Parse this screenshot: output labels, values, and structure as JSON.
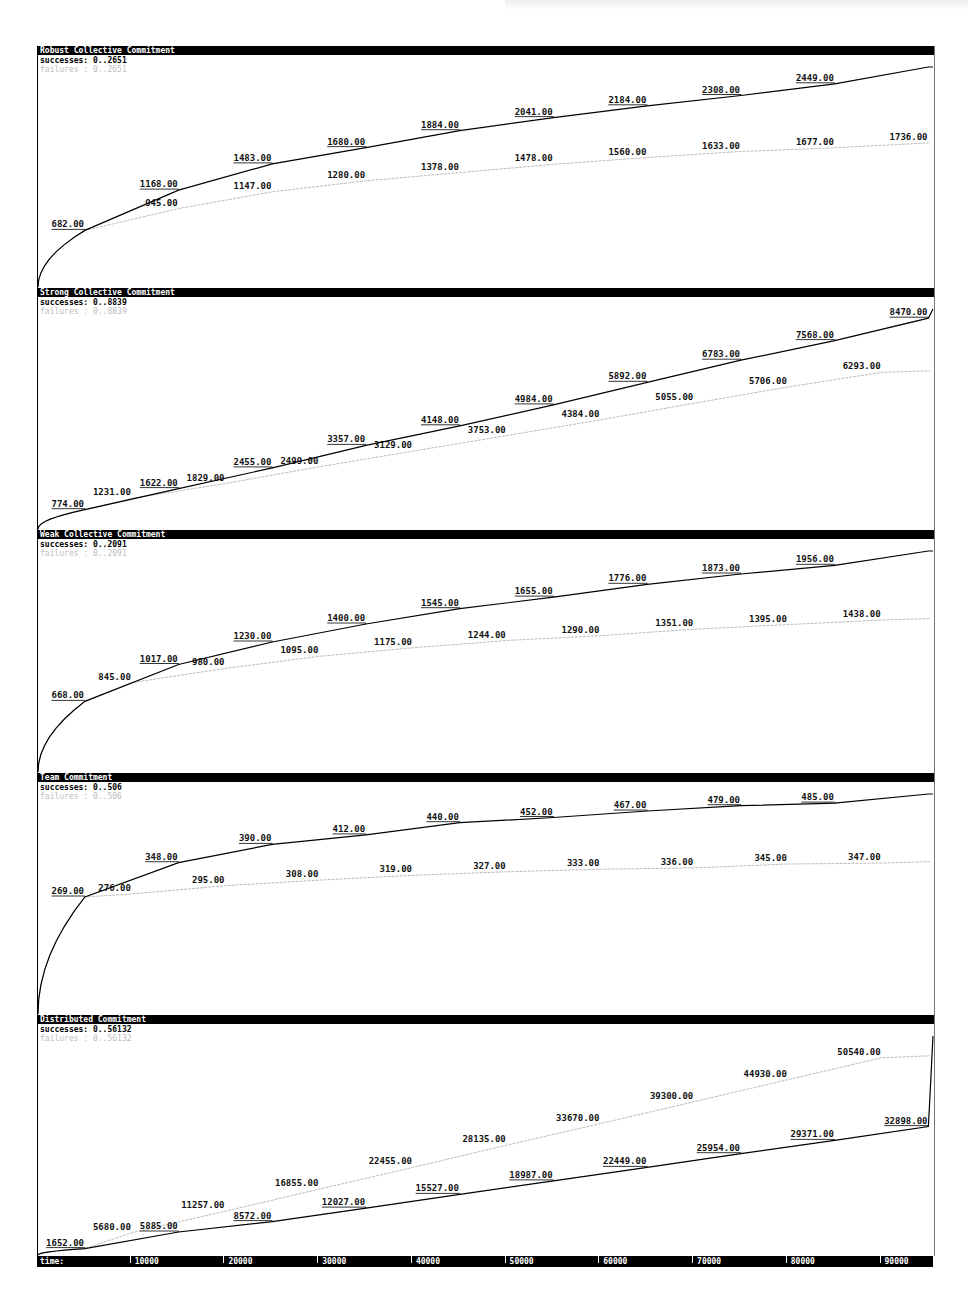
{
  "page": {
    "time_axis_label": "time:"
  },
  "chart_data": [
    {
      "type": "line",
      "title": "Robust Collective Commitment",
      "success_range": "successes: 0..2651",
      "failure_range": "failures : 0..2651",
      "ylim": [
        0,
        2651
      ],
      "x_ticks": [
        10000,
        20000,
        30000,
        40000,
        50000,
        60000,
        70000,
        80000,
        90000
      ],
      "series": [
        {
          "name": "successes",
          "color": "#000000",
          "x": [
            5000,
            15000,
            25000,
            35000,
            45000,
            55000,
            65000,
            75000,
            85000,
            95000
          ],
          "values": [
            682,
            1168,
            1483,
            1680,
            1884,
            2041,
            2184,
            2308,
            2449,
            2651
          ],
          "labels": [
            "682.00",
            "1168.00",
            "1483.00",
            "1680.00",
            "1884.00",
            "2041.00",
            "2184.00",
            "2308.00",
            "2449.00",
            ""
          ]
        },
        {
          "name": "failures",
          "color": "#bdbdbd",
          "x": [
            5000,
            15000,
            25000,
            35000,
            45000,
            55000,
            65000,
            75000,
            85000,
            95000
          ],
          "values": [
            682,
            945,
            1147,
            1280,
            1378,
            1478,
            1560,
            1633,
            1677,
            1736
          ],
          "labels": [
            "",
            "945.00",
            "1147.00",
            "1280.00",
            "1378.00",
            "1478.00",
            "1560.00",
            "1633.00",
            "1677.00",
            "1736.00"
          ]
        }
      ]
    },
    {
      "type": "line",
      "title": "Strong Collective Commitment",
      "success_range": "successes: 0..8839",
      "failure_range": "failures : 0..8839",
      "ylim": [
        0,
        8839
      ],
      "series": [
        {
          "name": "successes",
          "color": "#000000",
          "x": [
            5000,
            15000,
            25000,
            35000,
            45000,
            55000,
            65000,
            75000,
            85000,
            95000
          ],
          "values": [
            774,
            1622,
            2455,
            3357,
            4148,
            4984,
            5892,
            6783,
            7568,
            8470
          ],
          "labels": [
            "774.00",
            "1622.00",
            "2455.00",
            "3357.00",
            "4148.00",
            "4984.00",
            "5892.00",
            "6783.00",
            "7568.00",
            "8470.00"
          ]
        },
        {
          "name": "failures",
          "color": "#bdbdbd",
          "x": [
            5000,
            10000,
            20000,
            30000,
            40000,
            50000,
            60000,
            70000,
            80000,
            90000
          ],
          "values": [
            774,
            1231,
            1829,
            2499,
            3129,
            3753,
            4384,
            5055,
            5706,
            6293
          ],
          "labels": [
            "",
            "1231.00",
            "1829.00",
            "2499.00",
            "3129.00",
            "3753.00",
            "4384.00",
            "5055.00",
            "5706.00",
            "6293.00"
          ]
        }
      ]
    },
    {
      "type": "line",
      "title": "Weak Collective Commitment",
      "success_range": "successes: 0..2091",
      "failure_range": "failures : 0..2091",
      "ylim": [
        0,
        2091
      ],
      "series": [
        {
          "name": "successes",
          "color": "#000000",
          "x": [
            5000,
            15000,
            25000,
            35000,
            45000,
            55000,
            65000,
            75000,
            85000,
            95000
          ],
          "values": [
            668,
            1017,
            1230,
            1400,
            1545,
            1655,
            1776,
            1873,
            1956,
            2091
          ],
          "labels": [
            "668.00",
            "1017.00",
            "1230.00",
            "1400.00",
            "1545.00",
            "1655.00",
            "1776.00",
            "1873.00",
            "1956.00",
            ""
          ]
        },
        {
          "name": "failures",
          "color": "#bdbdbd",
          "x": [
            5000,
            10000,
            20000,
            30000,
            40000,
            50000,
            60000,
            70000,
            80000,
            90000
          ],
          "values": [
            668,
            845,
            980,
            1095,
            1175,
            1244,
            1290,
            1351,
            1395,
            1438
          ],
          "labels": [
            "",
            "845.00",
            "980.00",
            "1095.00",
            "1175.00",
            "1244.00",
            "1290.00",
            "1351.00",
            "1395.00",
            "1438.00"
          ]
        }
      ]
    },
    {
      "type": "line",
      "title": "Team Commitment",
      "success_range": "successes: 0..506",
      "failure_range": "failures : 0..506",
      "ylim": [
        0,
        506
      ],
      "series": [
        {
          "name": "successes",
          "color": "#000000",
          "x": [
            5000,
            15000,
            25000,
            35000,
            45000,
            55000,
            65000,
            75000,
            85000,
            95000
          ],
          "values": [
            269,
            348,
            390,
            412,
            440,
            452,
            467,
            479,
            485,
            506
          ],
          "labels": [
            "269.00",
            "348.00",
            "390.00",
            "412.00",
            "440.00",
            "452.00",
            "467.00",
            "479.00",
            "485.00",
            ""
          ]
        },
        {
          "name": "failures",
          "color": "#bdbdbd",
          "x": [
            5000,
            10000,
            20000,
            30000,
            40000,
            50000,
            60000,
            70000,
            80000,
            90000
          ],
          "values": [
            269,
            276,
            295,
            308,
            319,
            327,
            333,
            336,
            345,
            347
          ],
          "labels": [
            "",
            "276.00",
            "295.00",
            "308.00",
            "319.00",
            "327.00",
            "333.00",
            "336.00",
            "345.00",
            "347.00"
          ]
        }
      ]
    },
    {
      "type": "line",
      "title": "Distributed Commitment",
      "success_range": "successes: 0..56132",
      "failure_range": "failures : 0..56132",
      "ylim": [
        0,
        56132
      ],
      "xlabel": "time:",
      "series": [
        {
          "name": "successes",
          "color": "#000000",
          "x": [
            5000,
            15000,
            25000,
            35000,
            45000,
            55000,
            65000,
            75000,
            85000,
            95000
          ],
          "values": [
            1652,
            5885,
            8572,
            12027,
            15527,
            18987,
            22449,
            25954,
            29371,
            32898
          ],
          "labels": [
            "1652.00",
            "5885.00",
            "8572.00",
            "12027.00",
            "15527.00",
            "18987.00",
            "22449.00",
            "25954.00",
            "29371.00",
            "32898.00"
          ]
        },
        {
          "name": "failures",
          "color": "#bdbdbd",
          "x": [
            5000,
            10000,
            20000,
            30000,
            40000,
            50000,
            60000,
            70000,
            80000,
            90000
          ],
          "values": [
            1652,
            5680,
            11257,
            16855,
            22455,
            28135,
            33670,
            39300,
            44930,
            50540
          ],
          "labels": [
            "",
            "5680.00",
            "11257.00",
            "16855.00",
            "22455.00",
            "28135.00",
            "33670.00",
            "39300.00",
            "44930.00",
            "50540.00"
          ]
        }
      ]
    }
  ],
  "time_axis": {
    "label": "time:",
    "ticks": [
      "10000",
      "20000",
      "30000",
      "40000",
      "50000",
      "60000",
      "70000",
      "80000",
      "90000"
    ]
  }
}
